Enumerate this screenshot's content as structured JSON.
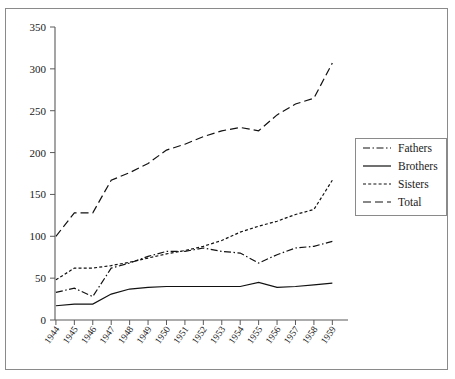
{
  "chart_data": {
    "type": "line",
    "title": "",
    "xlabel": "",
    "ylabel": "",
    "grid": false,
    "legend_position": "right-middle",
    "ylim": [
      0,
      350
    ],
    "yticks": [
      0,
      50,
      100,
      150,
      200,
      250,
      300,
      350
    ],
    "categories": [
      "1944",
      "1945",
      "1946",
      "1947",
      "1948",
      "1949",
      "1950",
      "1951",
      "1952",
      "1953",
      "1954",
      "1955",
      "1956",
      "1957",
      "1958",
      "1959"
    ],
    "series": [
      {
        "name": "Fathers",
        "style": "dash-dot",
        "values": [
          33,
          38,
          28,
          62,
          68,
          76,
          82,
          82,
          86,
          82,
          80,
          68,
          78,
          86,
          88,
          94
        ]
      },
      {
        "name": "Brothers",
        "style": "solid",
        "values": [
          17,
          19,
          19,
          31,
          37,
          39,
          40,
          40,
          40,
          40,
          40,
          45,
          39,
          40,
          42,
          44
        ]
      },
      {
        "name": "Sisters",
        "style": "dashed",
        "values": [
          48,
          62,
          62,
          65,
          69,
          74,
          79,
          83,
          88,
          95,
          105,
          112,
          118,
          126,
          132,
          167
        ]
      },
      {
        "name": "Total",
        "style": "long-dash",
        "values": [
          100,
          128,
          128,
          167,
          176,
          187,
          203,
          210,
          219,
          226,
          230,
          226,
          245,
          258,
          265,
          307
        ]
      }
    ]
  },
  "legend": {
    "items": [
      {
        "label": "Fathers",
        "style": "dash-dot"
      },
      {
        "label": "Brothers",
        "style": "solid"
      },
      {
        "label": "Sisters",
        "style": "dashed"
      },
      {
        "label": "Total",
        "style": "long-dash"
      }
    ]
  }
}
